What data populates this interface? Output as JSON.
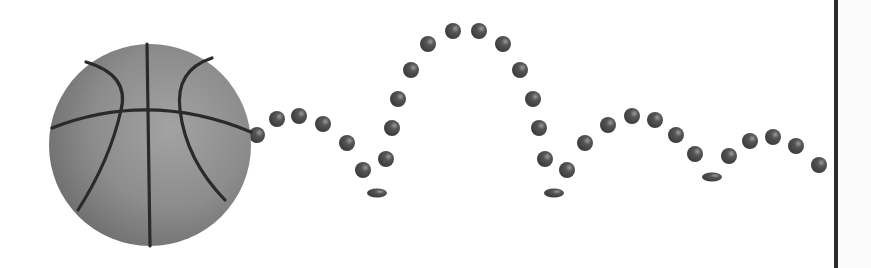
{
  "scene": {
    "description": "Basketball bouncing trajectory illustration",
    "background": "#ffffff",
    "ball": {
      "cx": 150,
      "cy": 145,
      "r": 101,
      "fill": "#8a8a8a",
      "seam": "#2a2a2a"
    },
    "dot_color": "#4a4a4a",
    "dot_radius": 8,
    "dots": [
      [
        257,
        135
      ],
      [
        277,
        119
      ],
      [
        299,
        116
      ],
      [
        323,
        124
      ],
      [
        347,
        143
      ],
      [
        363,
        170
      ],
      [
        386,
        159
      ],
      [
        392,
        128
      ],
      [
        398,
        99
      ],
      [
        411,
        70
      ],
      [
        428,
        44
      ],
      [
        453,
        31
      ],
      [
        479,
        31
      ],
      [
        503,
        44
      ],
      [
        520,
        70
      ],
      [
        533,
        99
      ],
      [
        539,
        128
      ],
      [
        545,
        159
      ],
      [
        567,
        170
      ],
      [
        585,
        143
      ],
      [
        608,
        125
      ],
      [
        632,
        116
      ],
      [
        655,
        120
      ],
      [
        676,
        135
      ],
      [
        695,
        154
      ],
      [
        729,
        156
      ],
      [
        750,
        141
      ],
      [
        773,
        137
      ],
      [
        796,
        146
      ],
      [
        819,
        165
      ]
    ],
    "squashed_dots": [
      [
        377,
        193
      ],
      [
        554,
        193
      ],
      [
        712,
        177
      ]
    ],
    "divider_x": 836
  }
}
